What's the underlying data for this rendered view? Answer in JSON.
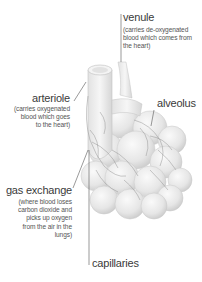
{
  "diagram": {
    "type": "anatomical illustration",
    "labels": {
      "venule": {
        "title": "venule",
        "description_lines": [
          "(carries de-oxygenated",
          "blood which comes from",
          "the heart)"
        ]
      },
      "arteriole": {
        "title": "arteriole",
        "description_lines": [
          "(carries oxygenated",
          "blood which goes",
          "to the heart)"
        ]
      },
      "alveolus": {
        "title": "alveolus"
      },
      "gas_exchange": {
        "title": "gas exchange",
        "description_lines": [
          "(where blood loses",
          "carbon dioxide and",
          "picks up oxygen",
          "from the air in the",
          "lungs)"
        ]
      },
      "capillaries": {
        "title": "capillaries"
      }
    },
    "colors": {
      "background": "#ffffff",
      "text": "#3a3a3a",
      "leader_line": "#555555",
      "alveoli_fill": "#ececec",
      "vessel_line": "#8a8a8a"
    }
  }
}
